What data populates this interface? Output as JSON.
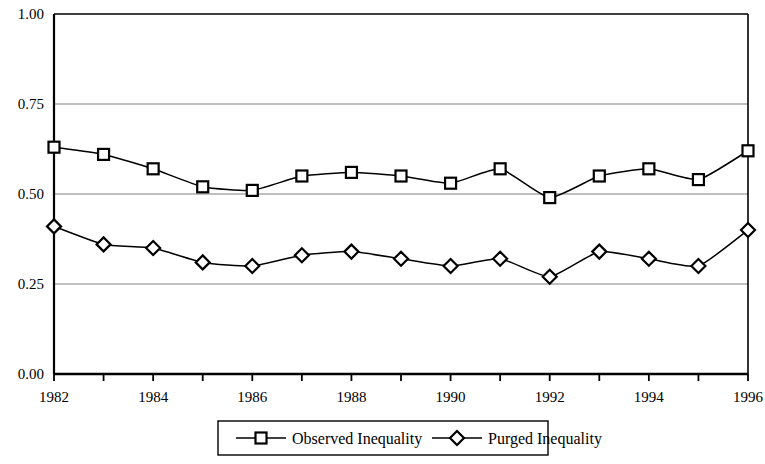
{
  "chart_data": {
    "type": "line",
    "title": "",
    "subtitle": "",
    "xlabel": "",
    "ylabel": "",
    "x": [
      1982,
      1983,
      1984,
      1985,
      1986,
      1987,
      1988,
      1989,
      1990,
      1991,
      1992,
      1993,
      1994,
      1995,
      1996
    ],
    "xlim": [
      1982,
      1996
    ],
    "ylim": [
      0.0,
      1.0
    ],
    "grid": true,
    "grid_axis": "y",
    "y_ticks": [
      0.0,
      0.25,
      0.5,
      0.75,
      1.0
    ],
    "y_tick_labels": [
      "0.00",
      "0.25",
      "0.50",
      "0.75",
      "1.00"
    ],
    "x_ticks": [
      1982,
      1983,
      1984,
      1985,
      1986,
      1987,
      1988,
      1989,
      1990,
      1991,
      1992,
      1993,
      1994,
      1995,
      1996
    ],
    "x_tick_labels": [
      "1982",
      "",
      "1984",
      "",
      "1986",
      "",
      "1988",
      "",
      "1990",
      "",
      "1992",
      "",
      "1994",
      "",
      "1996"
    ],
    "x_tick_labels_shown": [
      "1982",
      "1984",
      "1986",
      "1988",
      "1990",
      "1992",
      "1994",
      "1996"
    ],
    "legend_position": "bottom",
    "series": [
      {
        "name": "Observed Inequality",
        "marker": "square",
        "color": "#000000",
        "values": [
          0.63,
          0.61,
          0.57,
          0.52,
          0.51,
          0.55,
          0.56,
          0.55,
          0.53,
          0.57,
          0.49,
          0.55,
          0.57,
          0.54,
          0.62
        ]
      },
      {
        "name": "Purged Inequality",
        "marker": "diamond",
        "color": "#000000",
        "values": [
          0.41,
          0.36,
          0.35,
          0.31,
          0.3,
          0.33,
          0.34,
          0.32,
          0.3,
          0.32,
          0.27,
          0.34,
          0.32,
          0.3,
          0.4
        ]
      }
    ]
  },
  "legend": {
    "items": [
      {
        "label": "Observed Inequality",
        "marker": "square"
      },
      {
        "label": "Purged Inequality",
        "marker": "diamond"
      }
    ]
  },
  "axes": {
    "y_labels": [
      "1.00",
      "0.75",
      "0.50",
      "0.25",
      "0.00"
    ],
    "x_labels": [
      "1982",
      "1984",
      "1986",
      "1988",
      "1990",
      "1992",
      "1994",
      "1996"
    ]
  }
}
